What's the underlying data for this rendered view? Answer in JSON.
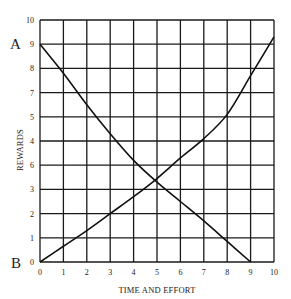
{
  "chart_data": {
    "type": "line",
    "title": "",
    "xlabel": "TIME AND EFFORT",
    "ylabel": "REWARDS",
    "xlim": [
      0,
      10
    ],
    "ylim": [
      0,
      10
    ],
    "grid": true,
    "legend": null,
    "x_tick_labels": [
      "0",
      "1",
      "2",
      "3",
      "4",
      "5",
      "6",
      "7",
      "8",
      "9",
      "10"
    ],
    "y_tick_labels_top_to_bottom": [
      "10",
      "9",
      "8",
      "7",
      "5",
      "4",
      "6",
      "3",
      "2",
      "1",
      "0"
    ],
    "annotations": [
      {
        "text": "A",
        "x": 0,
        "y": 9,
        "position": "left of y-axis at 9"
      },
      {
        "text": "B",
        "x": 0,
        "y": 0,
        "position": "left of y-axis at 0"
      }
    ],
    "series": [
      {
        "name": "decreasing curve (from A)",
        "x": [
          0,
          1,
          2,
          3,
          4,
          5,
          6,
          7,
          8,
          9
        ],
        "values": [
          9,
          7.8,
          6.5,
          5.3,
          4.2,
          3.3,
          2.5,
          1.7,
          0.85,
          0
        ]
      },
      {
        "name": "increasing curve (from B)",
        "x": [
          0,
          1,
          2,
          3,
          4,
          5,
          6,
          7,
          8,
          9,
          10
        ],
        "values": [
          0,
          0.65,
          1.3,
          2,
          2.7,
          3.45,
          4.3,
          5.1,
          6.1,
          7.7,
          9.3
        ]
      }
    ],
    "intersection": {
      "x": 4.9,
      "y": 3.4
    }
  },
  "labels": {
    "point_a": "A",
    "point_b": "B",
    "x_axis_title": "TIME AND EFFORT",
    "y_axis_title": "REWARDS"
  },
  "colors": {
    "background": "#ffffff",
    "grid": "#1a1a1a",
    "curve": "#111111",
    "text": "#222222"
  }
}
